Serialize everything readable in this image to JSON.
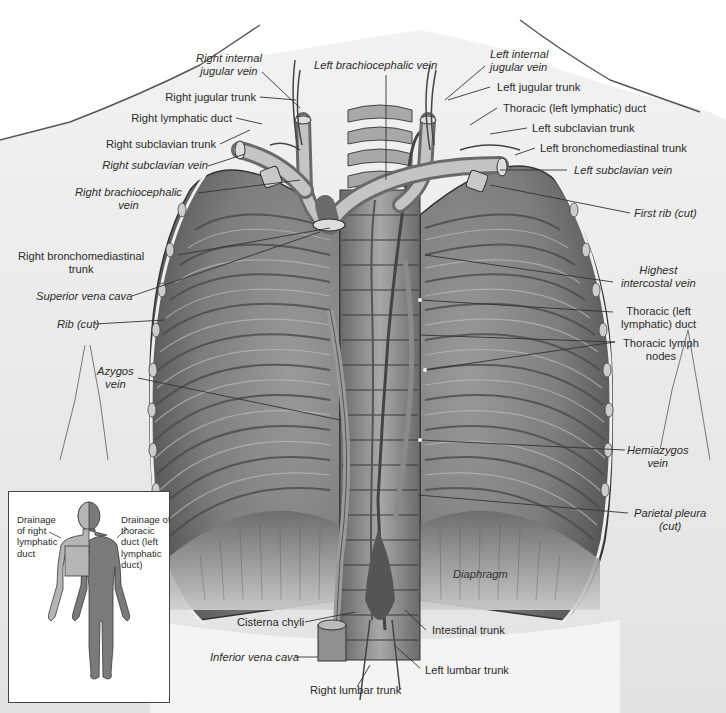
{
  "figure": {
    "colors": {
      "background": "#ffffff",
      "skin": "#e8e8e8",
      "rib_dark": "#5a5a5a",
      "rib_light": "#9a9a9a",
      "vessel": "#8a8a8a",
      "label_text": "#2b2b2b",
      "inset_right_region": "#b5b5b5",
      "inset_left_region": "#7a7a7a"
    }
  },
  "labels": {
    "right_internal_jugular_vein": "Right internal\njugular vein",
    "right_jugular_trunk": "Right jugular trunk",
    "right_lymphatic_duct": "Right lymphatic duct",
    "right_subclavian_trunk": "Right subclavian trunk",
    "right_subclavian_vein": "Right subclavian vein",
    "right_brachiocephalic_vein": "Right brachiocephalic\nvein",
    "right_bronchomediastinal_trunk": "Right bronchomediastinal\ntrunk",
    "superior_vena_cava": "Superior vena cava",
    "rib_cut": "Rib (cut)",
    "azygos_vein": "Azygos\nvein",
    "left_brachiocephalic_vein": "Left brachiocephalic vein",
    "left_internal_jugular_vein": "Left internal\njugular vein",
    "left_jugular_trunk": "Left jugular trunk",
    "thoracic_duct_top": "Thoracic (left lymphatic) duct",
    "left_subclavian_trunk": "Left subclavian trunk",
    "left_bronchomediastinal_trunk": "Left bronchomediastinal trunk",
    "left_subclavian_vein": "Left subclavian vein",
    "first_rib_cut": "First rib (cut)",
    "highest_intercostal_vein": "Highest\nintercostal vein",
    "thoracic_duct_mid": "Thoracic (left\nlymphatic) duct",
    "thoracic_lymph_nodes": "Thoracic lymph\nnodes",
    "hemiazygos_vein": "Hemiazygos\nvein",
    "parietal_pleura_cut": "Parietal pleura\n(cut)",
    "diaphragm": "Diaphragm",
    "cisterna_chyli": "Cisterna chyli",
    "inferior_vena_cava": "Inferior vena cava",
    "intestinal_trunk": "Intestinal trunk",
    "left_lumbar_trunk": "Left lumbar trunk",
    "right_lumbar_trunk": "Right lumbar trunk"
  },
  "inset": {
    "right_label": "Drainage\nof right\nlymphatic\nduct",
    "left_label": "Drainage of\nthoracic\nduct (left\nlymphatic\nduct)"
  }
}
